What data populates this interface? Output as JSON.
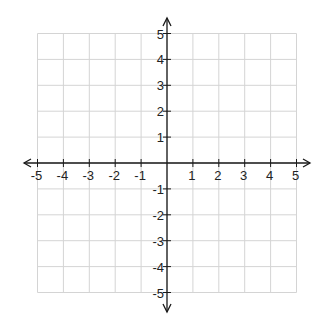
{
  "chart_data": {
    "type": "scatter",
    "title": "",
    "xlabel": "",
    "ylabel": "",
    "xlim": [
      -5,
      5
    ],
    "ylim": [
      -5,
      5
    ],
    "grid": true,
    "x_ticks": [
      -5,
      -4,
      -3,
      -2,
      -1,
      1,
      2,
      3,
      4,
      5
    ],
    "y_ticks": [
      -5,
      -4,
      -3,
      -2,
      -1,
      1,
      2,
      3,
      4,
      5
    ],
    "x_tick_labels": [
      "-5",
      "-4",
      "-3",
      "-2",
      "-1",
      "1",
      "2",
      "3",
      "4",
      "5"
    ],
    "y_tick_labels": [
      "-5",
      "-4",
      "-3",
      "-2",
      "-1",
      "1",
      "2",
      "3",
      "4",
      "5"
    ],
    "points": [],
    "axes_arrows": true,
    "legend": null
  },
  "colors": {
    "grid": "#d4d4d4",
    "axis": "#1a1a1a",
    "background": "#ffffff"
  }
}
